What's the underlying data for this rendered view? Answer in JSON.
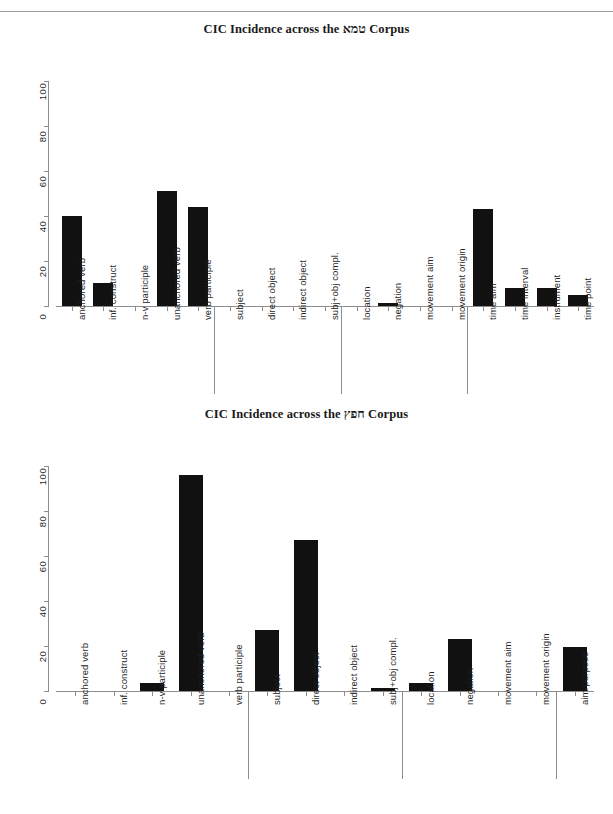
{
  "page": {
    "running_head": "",
    "background": "#ffffff",
    "bar_color": "#111111",
    "axis_color": "#8d8d8d",
    "text_color": "#1f1f1f"
  },
  "chart_data": [
    {
      "id": "tamei-chart",
      "type": "bar",
      "title": "CIC Incidence across the טמא Corpus",
      "xlabel": "",
      "ylabel": "",
      "ylim": [
        0,
        100
      ],
      "yticks": [
        0,
        20,
        40,
        60,
        80,
        100
      ],
      "grid": false,
      "legend": false,
      "orientation": "vertical",
      "categories": [
        "anchored verb",
        "inf. construct",
        "n-v participle",
        "unanchored verb",
        "verb participle",
        "subject",
        "direct object",
        "indirect object",
        "subj+obj compl.",
        "location",
        "negation",
        "movement aim",
        "movement origin",
        "time aim",
        "time interval",
        "instrument",
        "time point"
      ],
      "values": [
        40,
        10,
        0,
        51,
        44,
        0,
        0,
        0,
        0,
        0,
        1.5,
        0,
        0,
        43,
        8,
        8,
        5
      ],
      "groups": [
        {
          "label": "",
          "start": 0,
          "end": 4
        },
        {
          "label": "",
          "start": 5,
          "end": 8
        },
        {
          "label": "",
          "start": 9,
          "end": 12
        },
        {
          "label": "",
          "start": 13,
          "end": 16
        }
      ]
    },
    {
      "id": "chefetz-chart",
      "type": "bar",
      "title": "CIC Incidence across the חפץ Corpus",
      "xlabel": "",
      "ylabel": "",
      "ylim": [
        0,
        100
      ],
      "yticks": [
        0,
        20,
        40,
        60,
        80,
        100
      ],
      "grid": false,
      "legend": false,
      "orientation": "vertical",
      "categories": [
        "anchored verb",
        "inf. construct",
        "n-v participle",
        "unanchored verb",
        "verb participle",
        "subject",
        "direct object",
        "indirect object",
        "subj+obj compl.",
        "location",
        "negation",
        "movement aim",
        "movement origin",
        "aim/purpose"
      ],
      "values": [
        0,
        0,
        3.5,
        96,
        0,
        27,
        67,
        0,
        1.5,
        3.5,
        23,
        0,
        0,
        19.5
      ],
      "groups": [
        {
          "label": "",
          "start": 0,
          "end": 4
        },
        {
          "label": "",
          "start": 5,
          "end": 8
        },
        {
          "label": "",
          "start": 9,
          "end": 12
        },
        {
          "label": "",
          "start": 13,
          "end": 13
        }
      ]
    }
  ]
}
